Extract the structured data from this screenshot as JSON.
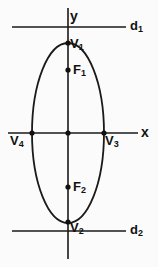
{
  "figure": {
    "background_color": "#fbfbfb",
    "stroke_color": "#1a1a1a",
    "label_color": "#111111",
    "axes": {
      "x_label": "x",
      "y_label": "y",
      "origin": {
        "x": 68,
        "y": 133
      },
      "x_axis": {
        "x1": 8,
        "y1": 133,
        "x2": 138,
        "y2": 133
      },
      "y_axis": {
        "x1": 68,
        "y1": 8,
        "x2": 68,
        "y2": 259
      }
    },
    "ellipse": {
      "center_x": 68,
      "center_y": 133,
      "semi_minor_x": 36,
      "semi_major_y": 90
    },
    "directrices": [
      {
        "name": "d1",
        "label": "d",
        "sub": "1",
        "x1": 12,
        "y1": 27,
        "x2": 126,
        "y2": 27
      },
      {
        "name": "d2",
        "label": "d",
        "sub": "2",
        "x1": 12,
        "y1": 231,
        "x2": 126,
        "y2": 231
      }
    ],
    "points": [
      {
        "name": "origin",
        "label": "",
        "sub": "",
        "x": 68,
        "y": 133
      },
      {
        "name": "vertex-1",
        "label": "V",
        "sub": "1",
        "x": 68,
        "y": 43
      },
      {
        "name": "vertex-2",
        "label": "V",
        "sub": "2",
        "x": 68,
        "y": 222
      },
      {
        "name": "vertex-3",
        "label": "V",
        "sub": "3",
        "x": 104,
        "y": 133
      },
      {
        "name": "vertex-4",
        "label": "V",
        "sub": "4",
        "x": 32,
        "y": 133
      },
      {
        "name": "focus-1",
        "label": "F",
        "sub": "1",
        "x": 68,
        "y": 70
      },
      {
        "name": "focus-2",
        "label": "F",
        "sub": "2",
        "x": 68,
        "y": 187
      }
    ]
  }
}
